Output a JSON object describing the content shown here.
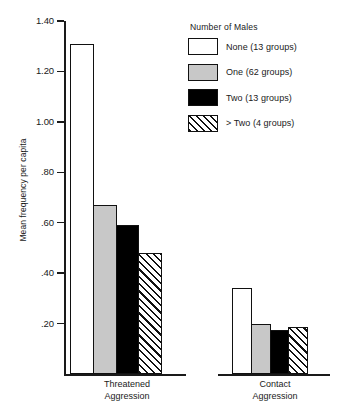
{
  "chart_data": {
    "type": "bar",
    "title": "",
    "xlabel": "",
    "ylabel": "Mean frequency per capita",
    "ylim": [
      0,
      1.4
    ],
    "yticks": [
      0.2,
      0.4,
      0.6,
      0.8,
      1.0,
      1.2,
      1.4
    ],
    "ytick_labels": [
      ".20",
      ".40",
      ".60",
      ".80",
      "1.00",
      "1.20",
      "1.40"
    ],
    "grid": false,
    "legend_position": "top-right",
    "legend_title": "Number of Males",
    "categories": [
      "Threatened Aggression",
      "Contact Aggression"
    ],
    "category_lines": [
      [
        "Threatened",
        "Aggression"
      ],
      [
        "Contact",
        "Aggression"
      ]
    ],
    "series": [
      {
        "name": "None (13 groups)",
        "key": "none",
        "fill": "white",
        "values": [
          1.31,
          0.34
        ]
      },
      {
        "name": "One (62 groups)",
        "key": "one",
        "fill": "gray",
        "values": [
          0.67,
          0.2
        ]
      },
      {
        "name": "Two (13 groups)",
        "key": "two",
        "fill": "black",
        "values": [
          0.59,
          0.175
        ]
      },
      {
        "name": "> Two (4 groups)",
        "key": "more_two",
        "fill": "hatch",
        "values": [
          0.48,
          0.185
        ]
      }
    ]
  },
  "axis": {
    "y_title": "Mean frequency per capita",
    "ticks": [
      {
        "label": "1.40",
        "value": 1.4
      },
      {
        "label": "1.20",
        "value": 1.2
      },
      {
        "label": "1.00",
        "value": 1.0
      },
      {
        "label": ".80",
        "value": 0.8
      },
      {
        "label": ".60",
        "value": 0.6
      },
      {
        "label": ".40",
        "value": 0.4
      },
      {
        "label": ".20",
        "value": 0.2
      }
    ]
  },
  "legend": {
    "title": "Number of Males",
    "items": [
      {
        "label": "None (13 groups)",
        "fill": "white"
      },
      {
        "label": "One (62 groups)",
        "fill": "gray"
      },
      {
        "label": "Two (13 groups)",
        "fill": "black"
      },
      {
        "label": "> Two (4 groups)",
        "fill": "hatch"
      }
    ]
  },
  "groups": [
    {
      "line1": "Threatened",
      "line2": "Aggression"
    },
    {
      "line1": "Contact",
      "line2": "Aggression"
    }
  ],
  "colors": {
    "ink": "#1a1a1a",
    "bar_outline": "#111111",
    "fill_white": "#ffffff",
    "fill_gray": "#c8c8c8",
    "fill_black": "#000000",
    "background": "#ffffff"
  }
}
